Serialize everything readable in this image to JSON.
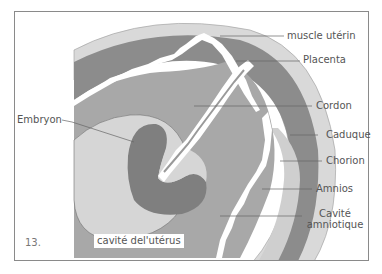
{
  "figure": {
    "number": "13.",
    "colors": {
      "muscle": "#d9d9d9",
      "placenta": "#8c8c8c",
      "cavity": "#a8a8a8",
      "amnion_sac": "#d6d6d6",
      "embryo": "#7f7f7f",
      "cord": "#ffffff",
      "leader_line": "#666666",
      "border": "#8a8a8a"
    }
  },
  "labels": {
    "muscle": "muscle utérin",
    "placenta": "Placenta",
    "cord": "Cordon",
    "decidua": "Caduque",
    "chorion": "Chorion",
    "amnion": "Amnios",
    "amniotic_cavity_line1": "Cavité",
    "amniotic_cavity_line2": "amniotique",
    "embryo": "Embryon",
    "uterine_cavity": "cavité del'utérus"
  }
}
